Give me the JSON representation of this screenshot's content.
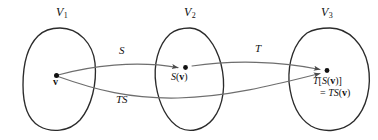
{
  "figure": {
    "colors": {
      "blob_stroke": "#2b2b2b",
      "arrow_stroke": "#6e6e6e",
      "dot_fill": "#111111",
      "background": "#ffffff",
      "text": "#111111"
    },
    "spaces": [
      {
        "name": "V-1",
        "label": "V",
        "subscript": "1"
      },
      {
        "name": "V-2",
        "label": "V",
        "subscript": "2"
      },
      {
        "name": "V-3",
        "label": "V",
        "subscript": "3"
      }
    ],
    "maps": [
      {
        "name": "map-S",
        "label": "S"
      },
      {
        "name": "map-T",
        "label": "T"
      },
      {
        "name": "map-TS",
        "label": "TS"
      }
    ],
    "points": {
      "source": {
        "label": "v"
      },
      "middle": {
        "prefix": "S",
        "open": "(",
        "vector": "v",
        "close": ")"
      },
      "target": {
        "line1_prefix": "T",
        "line1_open": "[",
        "line1_inner": "S",
        "line1_paren_open": "(",
        "line1_vector": "v",
        "line1_paren_close": ")",
        "line1_close": "]",
        "line2_equals": "=",
        "line2_prefix": "TS",
        "line2_open": "(",
        "line2_vector": "v",
        "line2_close": ")"
      }
    }
  }
}
